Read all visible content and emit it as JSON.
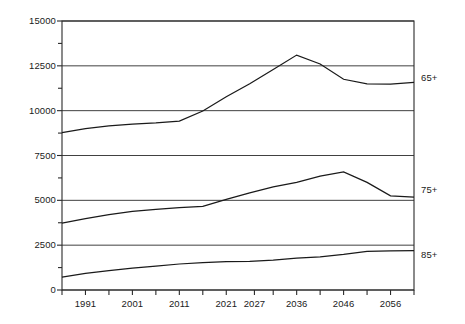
{
  "chart_data": {
    "type": "line",
    "title": "",
    "subtitle": "",
    "xlabel": "",
    "ylabel": "",
    "xlim": [
      1986,
      2061
    ],
    "ylim": [
      0,
      15000
    ],
    "grid": true,
    "grid_axis": "y",
    "legend_position": "right-inline",
    "y_ticks_major": [
      0,
      2500,
      5000,
      7500,
      10000,
      12500,
      15000
    ],
    "y_tick_labels": [
      "0",
      "2500",
      "5000",
      "7500",
      "10000",
      "12500",
      "15000"
    ],
    "y_ticks_minor": [
      1250,
      3750,
      6250,
      8750,
      11250,
      13750
    ],
    "x_ticks": [
      1986,
      1991,
      1996,
      2001,
      2006,
      2011,
      2016,
      2021,
      2026,
      2027,
      2031,
      2036,
      2041,
      2046,
      2051,
      2056,
      2061
    ],
    "x_tick_values": [
      1986,
      1991,
      1996,
      2001,
      2006,
      2011,
      2016,
      2021,
      2027,
      2031,
      2036,
      2041,
      2046,
      2051,
      2056,
      2061
    ],
    "x_tick_labels_shown": [
      "1991",
      "2001",
      "2011",
      "2021",
      "2027",
      "2036",
      "2046",
      "2056"
    ],
    "x": [
      1986,
      1991,
      1996,
      2001,
      2006,
      2011,
      2016,
      2021,
      2026,
      2031,
      2036,
      2041,
      2046,
      2051,
      2056,
      2061
    ],
    "series": [
      {
        "name": "65+",
        "label": "65+",
        "color": "#1a1a1a",
        "values": [
          8780,
          9000,
          9150,
          9250,
          9320,
          9420,
          9980,
          10780,
          11500,
          12300,
          13100,
          12600,
          11750,
          11500,
          11480,
          11580
        ]
      },
      {
        "name": "75+",
        "label": "75+",
        "color": "#1a1a1a",
        "values": [
          3730,
          3980,
          4200,
          4380,
          4500,
          4600,
          4660,
          5050,
          5420,
          5750,
          6000,
          6350,
          6580,
          6000,
          5250,
          5180
        ]
      },
      {
        "name": "85+",
        "label": "85+",
        "color": "#1a1a1a",
        "values": [
          720,
          930,
          1080,
          1220,
          1330,
          1450,
          1520,
          1580,
          1600,
          1660,
          1780,
          1850,
          1980,
          2150,
          2180,
          2200
        ]
      }
    ]
  },
  "axes": {
    "y_axis_name": "population-axis",
    "x_axis_name": "year-axis"
  },
  "series_labels": {
    "s65": "65+",
    "s75": "75+",
    "s85": "85+"
  }
}
